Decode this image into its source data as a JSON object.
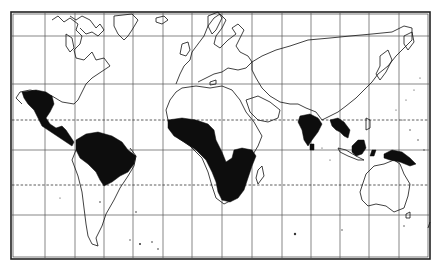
{
  "figure": {
    "type": "world-map",
    "projection": "mercator-style graticule",
    "style": "black-and-white line map with solid black shaded regions",
    "caption": "",
    "caption_legible": false
  },
  "colors": {
    "background": "#ffffff",
    "ink": "#111111",
    "grid": "#555555",
    "shaded_region": "#0d0d0d"
  },
  "frame": {
    "left": 11,
    "top": 12,
    "right": 430,
    "bottom": 259,
    "double_border": true
  },
  "graticule": {
    "vertical_lines_x": [
      45,
      75,
      104,
      133,
      163,
      192,
      222,
      252,
      282,
      311,
      340,
      369,
      399
    ],
    "horizontal_lines_y": [
      36,
      84,
      150,
      215
    ],
    "dashed_lines": [
      {
        "name": "tropic-of-cancer",
        "y": 120
      },
      {
        "name": "tropic-of-capricorn",
        "y": 185
      }
    ]
  },
  "shaded_regions": [
    {
      "name": "central-america-mexico",
      "label": "Mexico & Central America"
    },
    {
      "name": "amazon-basin",
      "label": "Northern South America"
    },
    {
      "name": "central-africa",
      "label": "Equatorial & Southern Africa"
    },
    {
      "name": "india",
      "label": "Indian Peninsula"
    },
    {
      "name": "indochina",
      "label": "Southeast Asia mainland"
    },
    {
      "name": "borneo",
      "label": "Borneo"
    },
    {
      "name": "new-guinea",
      "label": "New Guinea"
    }
  ]
}
